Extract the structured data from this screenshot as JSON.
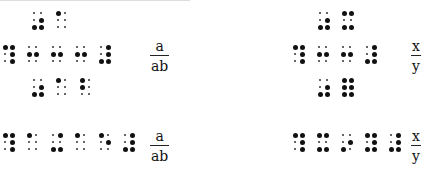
{
  "colors": {
    "ink": "#111111",
    "background": "#ffffff"
  },
  "left_panel": {
    "row_top": {
      "x": 31,
      "y": 10,
      "cells": [
        [
          3,
          5,
          6,
          5
        ],
        [
          1
        ]
      ]
    },
    "row_middle": {
      "x": 2,
      "y": 44,
      "cells": [
        [
          1,
          4,
          5,
          6
        ],
        [
          2,
          5
        ],
        [
          2,
          5
        ],
        [
          2,
          5
        ],
        [
          4,
          5,
          6,
          3
        ]
      ]
    },
    "row_bottom": {
      "x": 31,
      "y": 77,
      "cells": [
        [
          3,
          5,
          6
        ],
        [
          1
        ],
        [
          1,
          2
        ]
      ]
    },
    "fraction_1": {
      "x": 150,
      "y": 38,
      "numerator": "a",
      "denominator": "ab"
    },
    "linear": {
      "x": 2,
      "y": 132,
      "cells": [
        [
          1,
          4,
          5,
          6
        ],
        [
          1
        ],
        [
          3,
          4,
          6
        ],
        [
          1
        ],
        [
          1,
          5
        ],
        [
          3,
          4,
          5,
          6
        ]
      ]
    },
    "fraction_2": {
      "x": 150,
      "y": 132,
      "numerator": "a",
      "denominator": "ab"
    }
  },
  "right_panel": {
    "row_top": {
      "x": 317,
      "y": 10,
      "cells": [
        [
          3,
          5,
          6
        ],
        [
          1,
          4,
          3,
          6
        ]
      ]
    },
    "row_middle": {
      "x": 292,
      "y": 44,
      "cells": [
        [
          1,
          4,
          5,
          6
        ],
        [
          2,
          5
        ],
        [
          2,
          5
        ],
        [
          4,
          5,
          6,
          3
        ]
      ]
    },
    "row_bottom": {
      "x": 317,
      "y": 77,
      "cells": [
        [
          3,
          5,
          6
        ],
        [
          1,
          4,
          2,
          5,
          3,
          6
        ]
      ]
    },
    "fraction_1": {
      "x": 411,
      "y": 38,
      "numerator": "x",
      "denominator": "y"
    },
    "linear": {
      "x": 292,
      "y": 132,
      "cells": [
        [
          1,
          4,
          5,
          6
        ],
        [
          1,
          4,
          3,
          6
        ],
        [
          5,
          3
        ],
        [
          1,
          4,
          5,
          3,
          6
        ],
        [
          4,
          5,
          3,
          6
        ]
      ]
    },
    "fraction_2": {
      "x": 411,
      "y": 132,
      "numerator": "x",
      "denominator": "y"
    }
  }
}
